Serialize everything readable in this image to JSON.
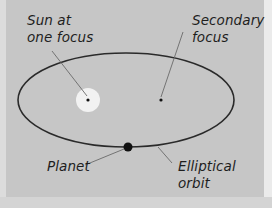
{
  "diagram": {
    "labels": {
      "sun": [
        "Sun at",
        "one focus"
      ],
      "secondary": [
        "Secondary",
        "focus"
      ],
      "planet": [
        "Planet"
      ],
      "orbit": [
        "Elliptical",
        "orbit"
      ]
    },
    "colors": {
      "background": "#c6c6c6",
      "orbit_line": "#2a2a2a",
      "leader_line": "#6a6a6a",
      "sun_glow": "#f2f2f2",
      "planet": "#111111",
      "text": "#1e1e1e"
    },
    "geometry": {
      "ellipse": {
        "cx": 126,
        "cy": 100,
        "rx": 108,
        "ry": 47
      },
      "sun": {
        "cx": 88,
        "cy": 100,
        "glow_r": 12,
        "dot_r": 1.6
      },
      "secondary_focus": {
        "cx": 161,
        "cy": 100,
        "dot_r": 1.6
      },
      "planet": {
        "cx": 128,
        "cy": 147,
        "r": 4.5
      }
    }
  }
}
